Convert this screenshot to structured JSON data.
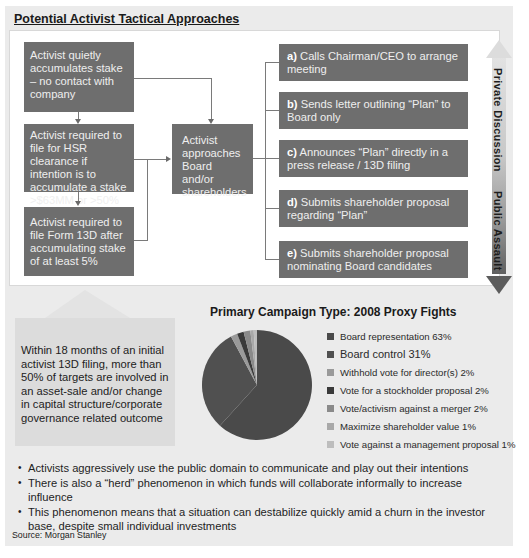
{
  "title": "Potential Activist Tactical Approaches",
  "flow": {
    "left_boxes": [
      {
        "text": "Activist quietly accumulates stake – no contact with company"
      },
      {
        "text": "Activist required to file for HSR clearance if intention is to accumulate a stake >$63MM or >50%"
      },
      {
        "text": "Activist required to file Form 13D after accumulating stake of at least 5%"
      }
    ],
    "center_box": {
      "text": "Activist approaches Board and/or shareholders"
    },
    "right_boxes": [
      {
        "letter": "a)",
        "text": "Calls Chairman/CEO to arrange meeting"
      },
      {
        "letter": "b)",
        "text": "Sends letter outlining “Plan” to Board only"
      },
      {
        "letter": "c)",
        "text": "Announces “Plan” directly in a press release / 13D filing"
      },
      {
        "letter": "d)",
        "text": "Submits shareholder proposal regarding “Plan”"
      },
      {
        "letter": "e)",
        "text": "Submits shareholder proposal nominating Board candidates"
      }
    ],
    "scale": {
      "top_label": "Private Discussion",
      "bottom_label": "Public Assault"
    }
  },
  "callout": {
    "text": "Within 18 months of an initial activist 13D filing, more than 50% of targets are involved in an asset-sale and/or change in capital structure/corporate governance related outcome"
  },
  "chart_data": {
    "type": "pie",
    "title": "Primary Campaign Type: 2008 Proxy Fights",
    "categories": [
      "Board representation",
      "Board control",
      "Withhold vote for director(s)",
      "Vote for a stockholder proposal",
      "Vote/activism against a merger",
      "Maximize shareholder value",
      "Vote against a management proposal"
    ],
    "values": [
      63,
      31,
      2,
      2,
      2,
      1,
      1
    ],
    "unit": "%",
    "legend_position": "right",
    "legend_labels": [
      "Board representation 63%",
      "Board control 31%",
      "Withhold vote for director(s) 2%",
      "Vote for a stockholder proposal 2%",
      "Vote/activism against a merger 2%",
      "Maximize shareholder value 1%",
      "Vote against a management proposal 1%"
    ],
    "colors": [
      "#4a4a4a",
      "#505050",
      "#9a9a9a",
      "#3a3a3a",
      "#8a8a8a",
      "#a8a8a8",
      "#bdbdbd"
    ]
  },
  "bullets": [
    "Activists aggressively use the public domain to communicate and play out their intentions",
    "There is also a “herd” phenomenon in which funds will collaborate informally to increase influence",
    "This phenomenon means that a situation can destabilize quickly amid a churn in the investor base, despite small individual investments"
  ],
  "source": "Source: Morgan Stanley"
}
